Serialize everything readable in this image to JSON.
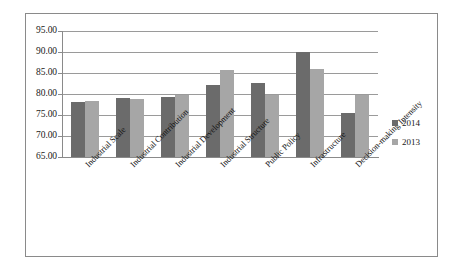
{
  "chart_data": {
    "type": "bar",
    "title": "",
    "subtitle": "",
    "xlabel": "",
    "ylabel": "",
    "ylim": [
      65.0,
      95.0
    ],
    "ytick_labels": [
      "95.00",
      "90.00",
      "85.00",
      "80.00",
      "75.00",
      "70.00",
      "65.00"
    ],
    "yticks": [
      95.0,
      90.0,
      85.0,
      80.0,
      75.0,
      70.0,
      65.0
    ],
    "grid": true,
    "legend_position": "right",
    "categories": [
      "Industrial Scale",
      "Industrial Contribution",
      "Industrial Development",
      "Industrial Structure",
      "Public Policy",
      "Infrastructure",
      "Decision-making Intensity"
    ],
    "series": [
      {
        "name": "2014",
        "color": "#6b6b6b",
        "values": [
          78.2,
          79.0,
          79.3,
          82.1,
          82.6,
          89.9,
          75.5
        ]
      },
      {
        "name": "2013",
        "color": "#a6a6a6",
        "values": [
          78.4,
          78.8,
          79.8,
          85.6,
          79.7,
          85.9,
          79.8
        ]
      }
    ]
  },
  "legend": {
    "items": [
      {
        "label": "2014",
        "color": "#6b6b6b"
      },
      {
        "label": "2013",
        "color": "#a6a6a6"
      }
    ]
  },
  "colors": {
    "series_2014": "#6b6b6b",
    "series_2013": "#a6a6a6",
    "gridline": "#9a9a9a",
    "axis": "#8a8a8a",
    "frame": "#8a8a8a",
    "background": "#ffffff",
    "text": "#1a1a1a"
  }
}
